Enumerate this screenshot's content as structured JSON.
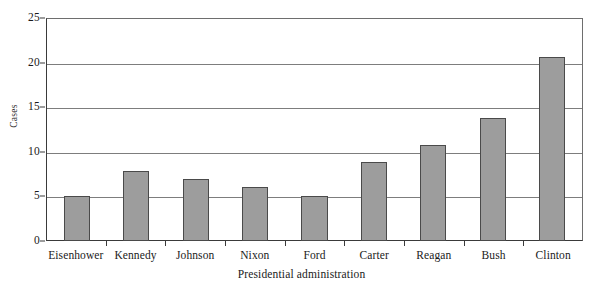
{
  "chart_data": {
    "type": "bar",
    "title": "",
    "subtitle": "",
    "xlabel": "Presidential administration",
    "ylabel": "Cases",
    "categories": [
      "Eisenhower",
      "Kennedy",
      "Johnson",
      "Nixon",
      "Ford",
      "Carter",
      "Reagan",
      "Bush",
      "Clinton"
    ],
    "values": [
      5.0,
      7.9,
      7.0,
      6.0,
      5.0,
      8.9,
      10.8,
      13.8,
      20.6
    ],
    "ylim": [
      0,
      25
    ],
    "yticks": [
      0,
      5,
      10,
      15,
      20,
      25
    ],
    "ytick_labels": [
      "0",
      "5",
      "10",
      "15",
      "20",
      "25"
    ],
    "grid": "horizontal",
    "legend": "none",
    "bar_color": "#9d9d9d",
    "bar_edge_color": "#4a4a4a",
    "axis_color": "#3a3a3a",
    "gridline_color": "#7d7d7d",
    "background_color": "#ffffff"
  }
}
